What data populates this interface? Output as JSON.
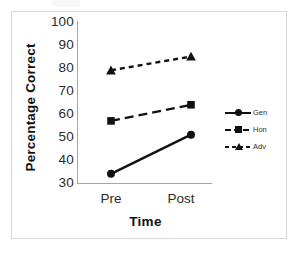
{
  "chart_data": {
    "type": "line",
    "title": "",
    "xlabel": "Time",
    "ylabel": "Percentage Correct",
    "categories": [
      "Pre",
      "Post"
    ],
    "ylim": [
      30,
      100
    ],
    "yticks": [
      30,
      40,
      50,
      60,
      70,
      80,
      90,
      100
    ],
    "ytick_labels": [
      "30",
      "40",
      "50",
      "60",
      "70",
      "80",
      "90",
      "100"
    ],
    "grid": false,
    "legend_position": "right",
    "series": [
      {
        "name": "Gen",
        "values": [
          34,
          51
        ],
        "marker": "circle",
        "linestyle": "solid",
        "color": "#111111"
      },
      {
        "name": "Hon",
        "values": [
          57,
          64
        ],
        "marker": "square",
        "linestyle": "dashed",
        "color": "#111111"
      },
      {
        "name": "Adv",
        "values": [
          79,
          85
        ],
        "marker": "triangle",
        "linestyle": "dotted",
        "color": "#111111"
      }
    ]
  },
  "axes": {
    "y_tick_0": "100",
    "y_tick_1": "90",
    "y_tick_2": "80",
    "y_tick_3": "70",
    "y_tick_4": "60",
    "y_tick_5": "50",
    "y_tick_6": "40",
    "y_tick_7": "30",
    "x_tick_0": "Pre",
    "x_tick_1": "Post",
    "x_title": "Time",
    "y_title": "Percentage Correct"
  },
  "legend": {
    "items": [
      {
        "label": "Gen"
      },
      {
        "label": "Hon"
      },
      {
        "label": "Adv"
      }
    ]
  },
  "colors": {
    "line": "#111111",
    "axis": "#a6a6a6",
    "frame": "#d9d9d9",
    "text": "#2b2b2b",
    "background": "#ffffff"
  }
}
